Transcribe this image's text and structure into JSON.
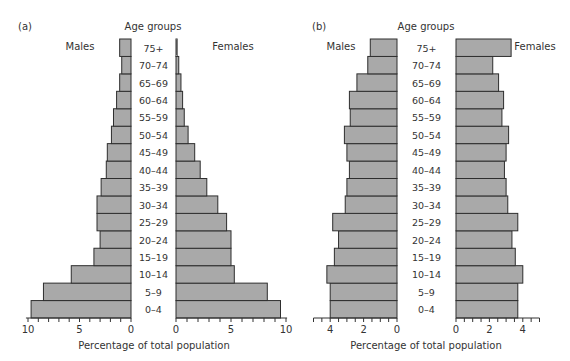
{
  "chart_data": [
    {
      "type": "bar",
      "subtype": "population-pyramid",
      "panel_label": "(a)",
      "title": "Age groups",
      "xlabel": "Percentage of total population",
      "ylabel": "Age groups",
      "categories": [
        "0-4",
        "5-9",
        "10-14",
        "15-19",
        "20-24",
        "25-29",
        "30-34",
        "35-39",
        "40-44",
        "45-49",
        "50-54",
        "55-59",
        "60-64",
        "65-69",
        "70-74",
        "75+"
      ],
      "series": [
        {
          "name": "Males",
          "values": [
            9.7,
            8.5,
            5.8,
            3.6,
            3.0,
            3.3,
            3.3,
            2.9,
            2.4,
            2.3,
            1.9,
            1.7,
            1.4,
            1.1,
            0.9,
            1.1
          ]
        },
        {
          "name": "Females",
          "values": [
            9.5,
            8.3,
            5.3,
            5.0,
            5.0,
            4.6,
            3.8,
            2.8,
            2.2,
            1.7,
            1.1,
            0.75,
            0.6,
            0.45,
            0.25,
            0.1
          ]
        }
      ],
      "xlim": [
        0,
        10
      ],
      "x_ticks_labeled": [
        10,
        5,
        0,
        0,
        5,
        10
      ],
      "grid": false,
      "legend_position": "labels above each side"
    },
    {
      "type": "bar",
      "subtype": "population-pyramid",
      "panel_label": "(b)",
      "title": "Age groups",
      "xlabel": "Percentage of total population",
      "ylabel": "Age groups",
      "categories": [
        "0-4",
        "5-9",
        "10-14",
        "15-19",
        "20-24",
        "25-29",
        "30-34",
        "35-39",
        "40-44",
        "45-49",
        "50-54",
        "55-59",
        "60-64",
        "65-69",
        "70-74",
        "75+"
      ],
      "series": [
        {
          "name": "Males",
          "values": [
            4.0,
            4.0,
            4.2,
            3.75,
            3.5,
            3.85,
            3.1,
            3.0,
            2.85,
            3.0,
            3.15,
            2.8,
            2.85,
            2.4,
            1.75,
            1.6
          ]
        },
        {
          "name": "Females",
          "values": [
            3.7,
            3.7,
            4.0,
            3.55,
            3.35,
            3.7,
            3.1,
            3.0,
            2.9,
            3.0,
            3.15,
            2.75,
            2.85,
            2.55,
            2.2,
            3.3
          ]
        }
      ],
      "xlim": [
        0,
        5
      ],
      "x_ticks_labeled": [
        4,
        2,
        0,
        0,
        2,
        4
      ],
      "grid": false,
      "legend_position": "labels above each side"
    }
  ],
  "panels": {
    "a": {
      "label": "(a)",
      "title": "Age groups",
      "males": "Males",
      "females": "Females",
      "xlabel": "Percentage of total population"
    },
    "b": {
      "label": "(b)",
      "title": "Age groups",
      "males": "Males",
      "females": "Females",
      "xlabel": "Percentage of total population"
    }
  },
  "age_labels": [
    "0–4",
    "5–9",
    "10–14",
    "15–19",
    "20–24",
    "25–29",
    "30–34",
    "35–39",
    "40–44",
    "45–49",
    "50–54",
    "55–59",
    "60–64",
    "65–69",
    "70–74",
    "75+"
  ],
  "colors": {
    "bar_fill": "#a9a9a9",
    "bar_stroke": "#2e2e2e",
    "text": "#333333"
  }
}
